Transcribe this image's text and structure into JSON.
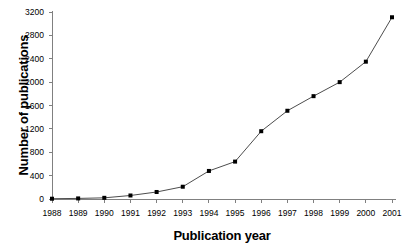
{
  "chart_data": {
    "type": "line",
    "title": "",
    "xlabel": "Publication year",
    "ylabel": "Number of publications",
    "categories": [
      "1988",
      "1989",
      "1990",
      "1991",
      "1992",
      "1993",
      "1994",
      "1995",
      "1996",
      "1997",
      "1998",
      "1999",
      "2000",
      "2001"
    ],
    "values": [
      5,
      10,
      20,
      60,
      120,
      210,
      480,
      640,
      1160,
      1510,
      1760,
      2000,
      2350,
      3110
    ],
    "series": [
      {
        "name": "Number of publications",
        "values": [
          5,
          10,
          20,
          60,
          120,
          210,
          480,
          640,
          1160,
          1510,
          1760,
          2000,
          2350,
          3110
        ]
      }
    ],
    "ylim": [
      0,
      3200
    ],
    "yticks": [
      0,
      400,
      800,
      1200,
      1600,
      2000,
      2400,
      2800,
      3200
    ],
    "ytick_labels": [
      "0",
      "400",
      "800",
      "1200",
      "1600",
      "2000",
      "2400",
      "2800",
      "3200"
    ],
    "xtick_labels": [
      "1988",
      "1989",
      "1990",
      "1991",
      "1992",
      "1993",
      "1994",
      "1995",
      "1996",
      "1997",
      "1998",
      "1999",
      "2000",
      "2001"
    ],
    "grid": false,
    "legend": false,
    "legend_position": "none",
    "marker": "square",
    "marker_color": "#000000",
    "line_color": "#4d4d4d",
    "axis_color": "#808080",
    "background_color": "#ffffff"
  }
}
